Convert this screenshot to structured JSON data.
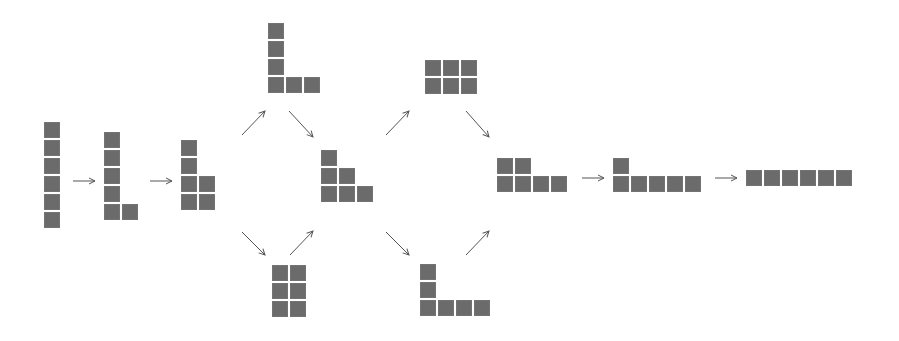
{
  "diagram": {
    "cell_color": "#6b6b6b",
    "arrow_color": "#555555",
    "cell_size": 16,
    "cell_pitch": 18,
    "shapes": [
      {
        "id": "p111111",
        "partition": [
          1,
          1,
          1,
          1,
          1,
          1
        ],
        "x": 44,
        "y": 122,
        "rows_top_to_bottom": [
          1,
          1,
          1,
          1,
          1,
          1
        ]
      },
      {
        "id": "p21111",
        "partition": [
          2,
          1,
          1,
          1,
          1
        ],
        "x": 104,
        "y": 132,
        "rows_top_to_bottom": [
          1,
          1,
          1,
          1,
          2
        ]
      },
      {
        "id": "p2211",
        "partition": [
          2,
          2,
          1,
          1
        ],
        "x": 181,
        "y": 140,
        "rows_top_to_bottom": [
          1,
          1,
          2,
          2
        ]
      },
      {
        "id": "p3111",
        "partition": [
          3,
          1,
          1,
          1
        ],
        "x": 268,
        "y": 23,
        "rows_top_to_bottom": [
          1,
          1,
          1,
          3
        ]
      },
      {
        "id": "p222",
        "partition": [
          2,
          2,
          2
        ],
        "x": 272,
        "y": 265,
        "rows_top_to_bottom": [
          2,
          2,
          2
        ]
      },
      {
        "id": "p321",
        "partition": [
          3,
          2,
          1
        ],
        "x": 321,
        "y": 150,
        "rows_top_to_bottom": [
          1,
          2,
          3
        ]
      },
      {
        "id": "p33",
        "partition": [
          3,
          3
        ],
        "x": 425,
        "y": 60,
        "rows_top_to_bottom": [
          3,
          3
        ]
      },
      {
        "id": "p411",
        "partition": [
          4,
          1,
          1
        ],
        "x": 420,
        "y": 264,
        "rows_top_to_bottom": [
          1,
          1,
          4
        ]
      },
      {
        "id": "p42",
        "partition": [
          4,
          2
        ],
        "x": 497,
        "y": 158,
        "rows_top_to_bottom": [
          2,
          4
        ]
      },
      {
        "id": "p51",
        "partition": [
          5,
          1
        ],
        "x": 613,
        "y": 158,
        "rows_top_to_bottom": [
          1,
          5
        ]
      },
      {
        "id": "p6",
        "partition": [
          6
        ],
        "x": 746,
        "y": 170,
        "rows_top_to_bottom": [
          6
        ]
      }
    ],
    "arrows": [
      {
        "from": "p111111",
        "to": "p21111",
        "x1": 73,
        "y1": 181,
        "x2": 95,
        "y2": 181
      },
      {
        "from": "p21111",
        "to": "p2211",
        "x1": 150,
        "y1": 181,
        "x2": 172,
        "y2": 181
      },
      {
        "from": "p2211",
        "to": "p3111",
        "x1": 242,
        "y1": 135,
        "x2": 265,
        "y2": 111
      },
      {
        "from": "p3111",
        "to": "p321",
        "x1": 289,
        "y1": 111,
        "x2": 313,
        "y2": 137
      },
      {
        "from": "p2211",
        "to": "p222",
        "x1": 242,
        "y1": 232,
        "x2": 265,
        "y2": 255
      },
      {
        "from": "p222",
        "to": "p321",
        "x1": 290,
        "y1": 255,
        "x2": 313,
        "y2": 231
      },
      {
        "from": "p321",
        "to": "p33",
        "x1": 386,
        "y1": 135,
        "x2": 409,
        "y2": 111
      },
      {
        "from": "p33",
        "to": "p42",
        "x1": 466,
        "y1": 111,
        "x2": 489,
        "y2": 137
      },
      {
        "from": "p321",
        "to": "p411",
        "x1": 386,
        "y1": 232,
        "x2": 409,
        "y2": 255
      },
      {
        "from": "p411",
        "to": "p42",
        "x1": 466,
        "y1": 255,
        "x2": 489,
        "y2": 231
      },
      {
        "from": "p42",
        "to": "p51",
        "x1": 582,
        "y1": 178,
        "x2": 604,
        "y2": 178
      },
      {
        "from": "p51",
        "to": "p6",
        "x1": 715,
        "y1": 178,
        "x2": 737,
        "y2": 178
      }
    ]
  }
}
